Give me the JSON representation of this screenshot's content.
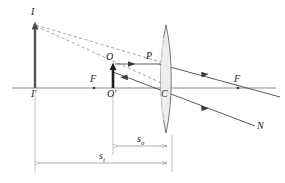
{
  "figure": {
    "type": "optics-ray-diagram",
    "colors": {
      "axis": "#8a8a8a",
      "ray": "#4a4a4a",
      "dashed_ray": "#8a8a8a",
      "lens_outline": "#555555",
      "lens_fill": "#eeeeee",
      "object_arrow": "#222222",
      "image_arrow": "#555555",
      "dimension_line": "#9a9a9a",
      "text": "#1a1a1a"
    },
    "labels": {
      "image_tip": "I",
      "image_base": "I'",
      "focal_left": "F",
      "object_tip": "O",
      "object_base": "O'",
      "ray_point_lens_top": "P",
      "lens_center": "C",
      "focal_right": "F",
      "refracted_ray_end": "N",
      "object_distance": "s",
      "object_distance_sub": "o",
      "image_distance": "s",
      "image_distance_sub": "i"
    },
    "geometry": {
      "optical_axis_y": 88,
      "axis_x_start": 12,
      "axis_x_end": 276,
      "lens_center_x": 166,
      "lens_top_y": 25,
      "lens_bottom_y": 133,
      "lens_half_width": 7,
      "image_arrow_x": 35,
      "image_arrow_top_y": 22,
      "object_arrow_x": 113,
      "object_arrow_top_y": 64,
      "point_P_x": 159,
      "point_P_y": 64,
      "focal_left_x": 94,
      "focal_right_x": 238,
      "dim_so_y": 146,
      "dim_si_y": 163,
      "dim_so_x_start": 113,
      "dim_so_x_end": 172,
      "dim_si_x_start": 35,
      "dim_si_x_end": 172
    },
    "elements": {
      "optical_axis": "horizontal-optical-axis",
      "lens": "biconvex-converging-lens",
      "object": "upright-object-arrow",
      "image": "virtual-image-arrow",
      "rays": [
        "parallel-ray-O-to-P",
        "refracted-ray-P-through-focal-F",
        "chief-ray-through-center-C-to-N",
        "virtual-ray-extension-I-to-P",
        "virtual-ray-extension-I-through-O"
      ]
    }
  }
}
